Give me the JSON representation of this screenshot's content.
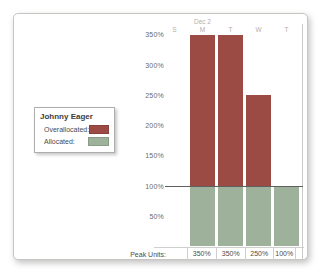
{
  "legend": {
    "resource_name": "Johnny Eager",
    "overallocated_label": "Overallocated:",
    "allocated_label": "Allocated:"
  },
  "colors": {
    "overallocated": "#9c4a44",
    "allocated": "#9eb29b"
  },
  "footer": {
    "peak_units_label": "Peak Units:"
  },
  "chart_data": {
    "type": "bar",
    "stacked": true,
    "title": "",
    "week_label": "Dec 2",
    "day_column_labels": [
      "S",
      "M",
      "T",
      "W",
      "T"
    ],
    "categories": [
      "M",
      "T",
      "W",
      "T"
    ],
    "series": [
      {
        "name": "Allocated",
        "color": "#9eb29b",
        "values": [
          100,
          100,
          100,
          100
        ]
      },
      {
        "name": "Overallocated",
        "color": "#9c4a44",
        "values": [
          250,
          250,
          150,
          0
        ]
      }
    ],
    "peak_units": [
      "350%",
      "350%",
      "250%",
      "100%"
    ],
    "y_tick_labels": [
      "350%",
      "300%",
      "250%",
      "200%",
      "150%",
      "100%",
      "50%"
    ],
    "y_axis_unit": "percent",
    "ylim": [
      0,
      350
    ],
    "reference_line_value": 100,
    "legend_position": "left",
    "grid": false
  }
}
